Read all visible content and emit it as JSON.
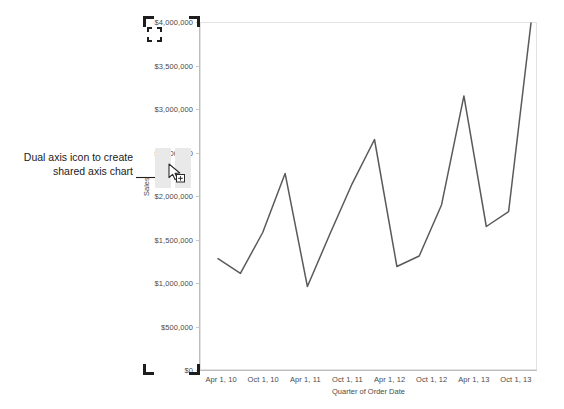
{
  "annotation": {
    "text": "Dual axis icon to create\nshared axis chart",
    "arrow_icon": "arrow-right-icon"
  },
  "icons": {
    "dual_axis": "dual-axis-icon",
    "cursor": "mouse-cursor-icon",
    "selection_corner": "selection-corner-icon"
  },
  "colors": {
    "line": "#5a5a5a",
    "axis": "#bdbdbd",
    "plot_border": "#e2e2e2",
    "tick_label": "#4a4a4a",
    "annotation_text": "#1b1b1b",
    "icon_pane": "#e9e9e9",
    "selection_bracket": "#1d1d1d"
  },
  "chart_data": {
    "type": "line",
    "title": "",
    "xlabel": "Quarter of Order Date",
    "ylabel": "Sales",
    "ylim": [
      0,
      4000000
    ],
    "ytick_labels": [
      "$4,000,000",
      "$3,500,000",
      "$3,000,000",
      "$2,500,000",
      "$2,000,000",
      "$1,500,000",
      "$1,000,000",
      "$500,000",
      "$0"
    ],
    "ytick_values": [
      4000000,
      3500000,
      3000000,
      2500000,
      2000000,
      1500000,
      1000000,
      500000,
      0
    ],
    "xtick_labels": [
      "Apr 1, 10",
      "Oct 1, 10",
      "Apr 1, 11",
      "Oct 1, 11",
      "Apr 1, 12",
      "Oct 1, 12",
      "Apr 1, 13",
      "Oct 1, 13"
    ],
    "grid": false,
    "legend": false,
    "series": [
      {
        "name": "Sales",
        "categories": [
          "Q2 2010",
          "Q3 2010",
          "Q4 2010",
          "Q1 2011",
          "Q2 2011",
          "Q3 2011",
          "Q4 2011",
          "Q1 2012",
          "Q2 2012",
          "Q3 2012",
          "Q4 2012",
          "Q1 2013",
          "Q2 2013",
          "Q3 2013",
          "Q4 2013"
        ],
        "values": [
          1280000,
          1110000,
          1580000,
          2260000,
          960000,
          1560000,
          2140000,
          2650000,
          1190000,
          1310000,
          1900000,
          3150000,
          1650000,
          1820000,
          3990000
        ]
      }
    ]
  }
}
